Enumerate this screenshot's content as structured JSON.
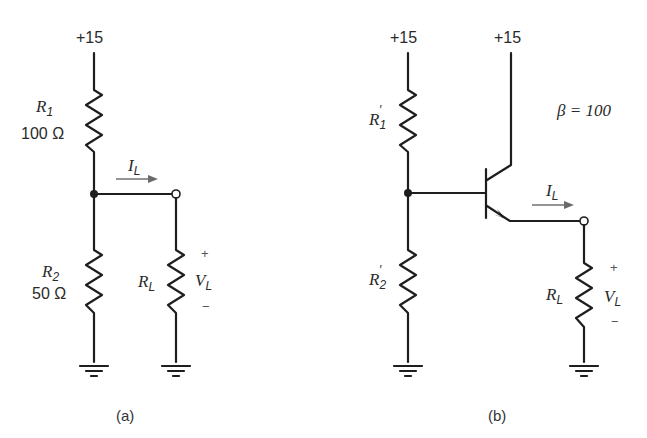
{
  "figure": {
    "circuit_a": {
      "caption": "(a)",
      "supply": "+15",
      "r1": {
        "name": "R",
        "sub": "1",
        "value": "100 Ω"
      },
      "r2": {
        "name": "R",
        "sub": "2",
        "value": "50 Ω"
      },
      "rl": {
        "name": "R",
        "sub": "L"
      },
      "current": {
        "name": "I",
        "sub": "L"
      },
      "voltage": {
        "name": "V",
        "sub": "L",
        "plus": "+",
        "minus": "−"
      }
    },
    "circuit_b": {
      "caption": "(b)",
      "supply_bias": "+15",
      "supply_collector": "+15",
      "beta": "β = 100",
      "r1p": {
        "name": "R",
        "sub": "1",
        "prime": "′"
      },
      "r2p": {
        "name": "R",
        "sub": "2",
        "prime": "′"
      },
      "rl": {
        "name": "R",
        "sub": "L"
      },
      "current": {
        "name": "I",
        "sub": "L"
      },
      "voltage": {
        "name": "V",
        "sub": "L",
        "plus": "+",
        "minus": "−"
      }
    }
  }
}
